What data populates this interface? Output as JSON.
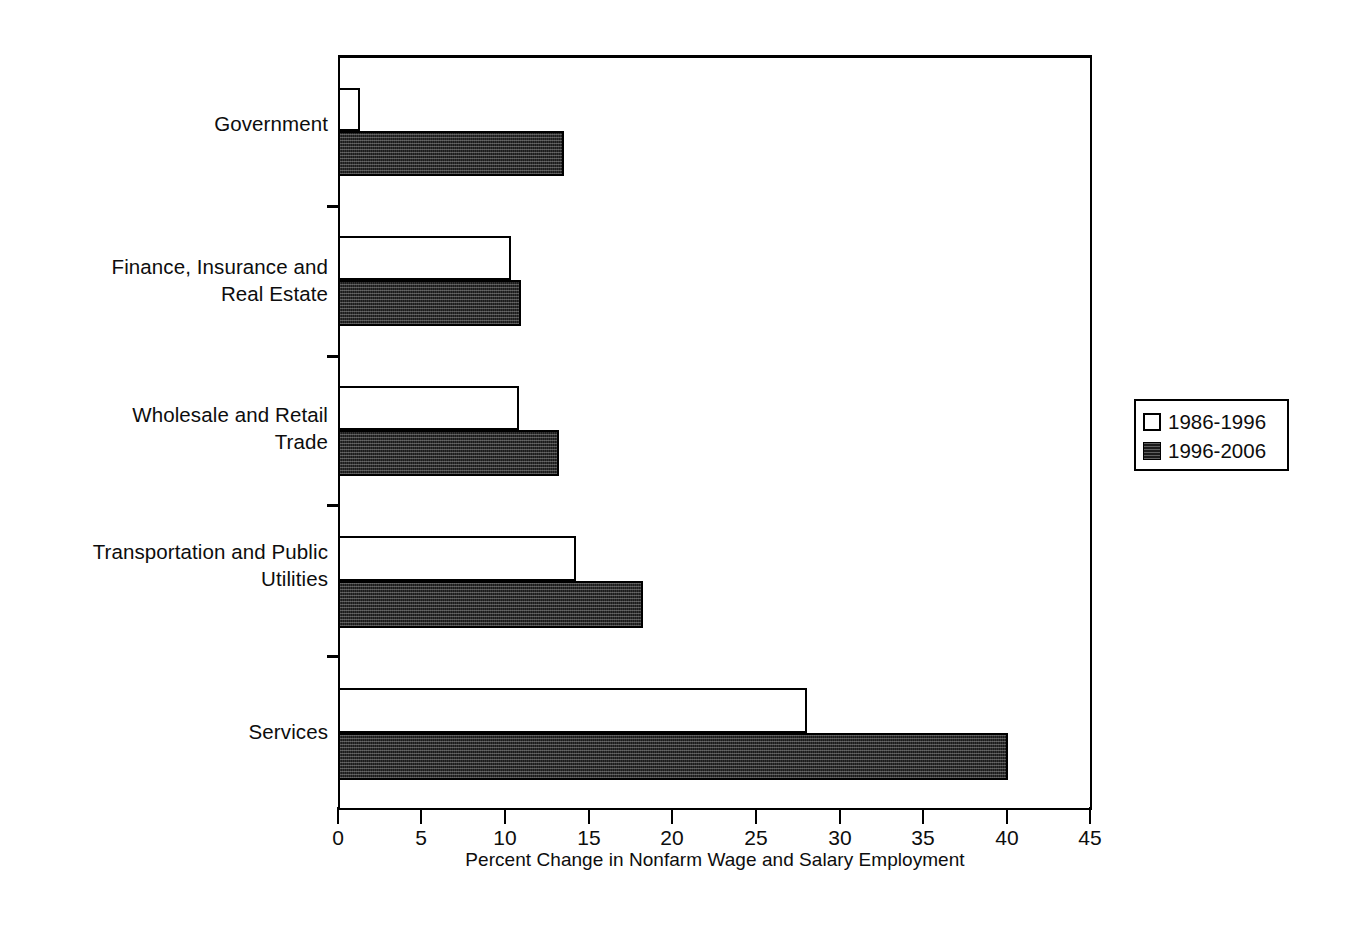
{
  "chart_data": {
    "type": "bar",
    "orientation": "horizontal",
    "title": "",
    "xlabel": "Percent Change in Nonfarm Wage and Salary Employment",
    "ylabel": "",
    "xlim": [
      0,
      45
    ],
    "xticks": [
      0,
      5,
      10,
      15,
      20,
      25,
      30,
      35,
      40,
      45
    ],
    "grid": false,
    "legend_position": "right",
    "categories": [
      "Government",
      "Finance, Insurance and\nReal Estate",
      "Wholesale and Retail\nTrade",
      "Transportation and Public\nUtilities",
      "Services"
    ],
    "series": [
      {
        "name": "1986-1996",
        "style": "open-white",
        "values": [
          1.3,
          10.3,
          10.8,
          14.2,
          28.0
        ]
      },
      {
        "name": "1996-2006",
        "style": "filled-dark-hatch",
        "values": [
          13.5,
          10.9,
          13.2,
          18.2,
          40.0
        ]
      }
    ]
  },
  "axis": {
    "x_tick_labels": [
      "0",
      "5",
      "10",
      "15",
      "20",
      "25",
      "30",
      "35",
      "40",
      "45"
    ],
    "x_title": "Percent Change in Nonfarm Wage and Salary Employment"
  },
  "legend": {
    "entries": [
      {
        "label": "1986-1996",
        "swatch": "open-square-icon"
      },
      {
        "label": "1996-2006",
        "swatch": "filled-square-icon"
      }
    ]
  },
  "colors": {
    "axis": "#000000",
    "series_1986_1996": "#ffffff",
    "series_1996_2006": "#1b1b1b",
    "background": "#ffffff",
    "text": "#0d0d0d"
  }
}
